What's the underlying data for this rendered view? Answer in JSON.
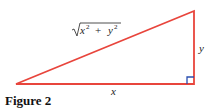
{
  "figure": {
    "caption": "Figure 2",
    "hypotenuse_label": "√x² + y²",
    "hyp_base": "x",
    "hyp_plus": "+",
    "hyp_y": "y",
    "exp": "2",
    "vertical_label": "y",
    "horizontal_label": "x"
  },
  "colors": {
    "triangle": "#e8453c",
    "right_angle_marker": "#2a4fb0"
  }
}
